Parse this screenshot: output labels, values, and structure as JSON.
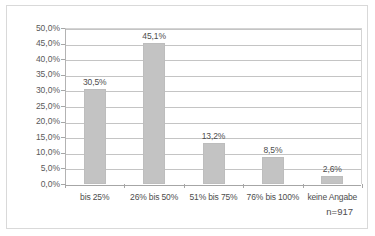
{
  "chart_data": {
    "type": "bar",
    "title": "",
    "subtitle": "",
    "xlabel": "",
    "ylabel": "",
    "categories": [
      "bis 25%",
      "26% bis 50%",
      "51% bis 75%",
      "76% bis 100%",
      "keine Angabe"
    ],
    "values": [
      30.5,
      45.1,
      13.2,
      8.5,
      2.6
    ],
    "value_labels": [
      "30,5%",
      "45,1%",
      "13,2%",
      "8,5%",
      "2,6%"
    ],
    "ylim": [
      0,
      50
    ],
    "ytick_values": [
      0,
      5,
      10,
      15,
      20,
      25,
      30,
      35,
      40,
      45,
      50
    ],
    "ytick_labels": [
      "0,0%",
      "5,0%",
      "10,0%",
      "15,0%",
      "20,0%",
      "25,0%",
      "30,0%",
      "35,0%",
      "40,0%",
      "45,0%",
      "50,0%"
    ],
    "grid": true,
    "grid_axis": "y",
    "legend": false,
    "legend_position": "none",
    "annotations": [
      {
        "name": "sample-size",
        "text": "n=917"
      }
    ],
    "colors": {
      "bar_fill": "#c3c3c3",
      "bar_border": "#bdbdbd",
      "gridline": "#c4c4c4",
      "axis": "#a6a6a6",
      "text": "#4d4d4d",
      "tick_text": "#5a5a5a",
      "frame_border": "#d9d9d9",
      "background": "#ffffff"
    }
  }
}
